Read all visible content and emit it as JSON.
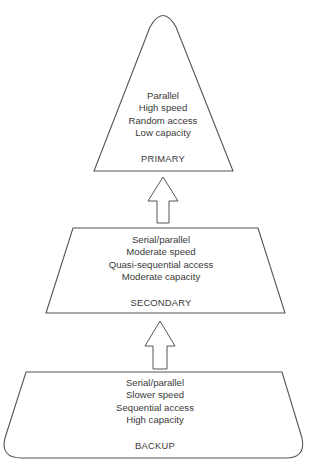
{
  "colors": {
    "stroke": "#555555",
    "text": "#3a3a3a",
    "background": "#ffffff"
  },
  "tiers": {
    "primary": {
      "label": "PRIMARY",
      "lines": [
        "Parallel",
        "High speed",
        "Random access",
        "Low capacity"
      ]
    },
    "secondary": {
      "label": "SECONDARY",
      "lines": [
        "Serial/parallel",
        "Moderate speed",
        "Quasi-sequential access",
        "Moderate capacity"
      ]
    },
    "backup": {
      "label": "BACKUP",
      "lines": [
        "Serial/parallel",
        "Slower speed",
        "Sequential access",
        "High capacity"
      ]
    }
  },
  "arrows": [
    {
      "from": "secondary",
      "to": "primary",
      "icon": "up-arrow-icon"
    },
    {
      "from": "backup",
      "to": "secondary",
      "icon": "up-arrow-icon"
    }
  ]
}
